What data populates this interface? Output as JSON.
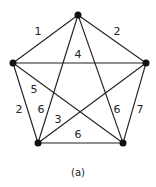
{
  "caption": "(a)",
  "graph": {
    "vertices": [
      {
        "id": "top",
        "x": 78,
        "y": 15
      },
      {
        "id": "left",
        "x": 13,
        "y": 63
      },
      {
        "id": "right",
        "x": 146,
        "y": 63
      },
      {
        "id": "bottom_left",
        "x": 38,
        "y": 143
      },
      {
        "id": "bottom_right",
        "x": 123,
        "y": 143
      }
    ],
    "edges": [
      {
        "from": "top",
        "to": "left",
        "weight": "1",
        "lx": 38,
        "ly": 35
      },
      {
        "from": "top",
        "to": "right",
        "weight": "2",
        "lx": 117,
        "ly": 35
      },
      {
        "from": "left",
        "to": "right",
        "weight": "4",
        "lx": 78,
        "ly": 58
      },
      {
        "from": "left",
        "to": "bottom_right",
        "weight": "5",
        "lx": 34,
        "ly": 93
      },
      {
        "from": "left",
        "to": "bottom_left",
        "weight": "2",
        "lx": 19,
        "ly": 113
      },
      {
        "from": "top",
        "to": "bottom_left",
        "weight": "6",
        "lx": 41,
        "ly": 113
      },
      {
        "from": "top",
        "to": "bottom_right",
        "weight": "6",
        "lx": 117,
        "ly": 113
      },
      {
        "from": "right",
        "to": "bottom_left",
        "weight": "3",
        "lx": 58,
        "ly": 123
      },
      {
        "from": "right",
        "to": "bottom_right",
        "weight": "7",
        "lx": 140,
        "ly": 113
      },
      {
        "from": "bottom_left",
        "to": "bottom_right",
        "weight": "6",
        "lx": 78,
        "ly": 138
      }
    ]
  }
}
